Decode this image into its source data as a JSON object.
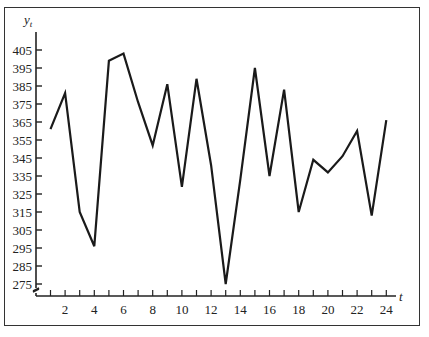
{
  "chart_data": {
    "type": "line",
    "title": "",
    "xlabel": "t",
    "ylabel": "y_t",
    "x": [
      1,
      2,
      3,
      4,
      5,
      6,
      7,
      8,
      9,
      10,
      11,
      12,
      13,
      14,
      15,
      16,
      17,
      18,
      19,
      20,
      21,
      22,
      23,
      24
    ],
    "values": [
      361,
      381,
      315,
      296,
      399,
      403,
      376,
      352,
      386,
      329,
      389,
      341,
      275,
      333,
      395,
      335,
      383,
      315,
      344,
      337,
      346,
      360,
      313,
      366
    ],
    "xticks": [
      2,
      4,
      6,
      8,
      10,
      12,
      14,
      16,
      18,
      20,
      22,
      24
    ],
    "yticks": [
      275,
      285,
      295,
      305,
      315,
      325,
      335,
      345,
      355,
      365,
      375,
      385,
      395,
      405
    ],
    "xlim": [
      0,
      25
    ],
    "ylim": [
      268,
      412
    ],
    "grid": false,
    "legend": null,
    "axis_break": "y-axis break symbol near origin"
  },
  "labels": {
    "y_axis_main": "y",
    "y_axis_sub": "t",
    "x_axis": "t"
  },
  "colors": {
    "line": "#1a1a1a",
    "axis": "#222222",
    "frame": "#333333"
  }
}
